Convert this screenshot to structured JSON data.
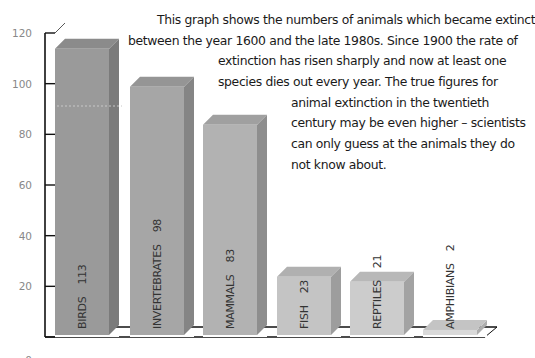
{
  "chart_data": {
    "type": "bar",
    "style": "3d-columns",
    "title": "",
    "xlabel": "",
    "ylabel": "",
    "ylim": [
      0,
      120
    ],
    "yticks": [
      0,
      20,
      40,
      60,
      80,
      100,
      120
    ],
    "grid": false,
    "legend": null,
    "categories": [
      "BIRDS",
      "INVERTEBRATES",
      "MAMMALS",
      "FISH",
      "REPTILES",
      "AMPHIBIANS"
    ],
    "values": [
      113,
      98,
      83,
      23,
      21,
      2
    ],
    "data_labels": [
      "113",
      "98",
      "83",
      "23",
      "21",
      "2"
    ],
    "annotation": "This graph shows the numbers of animals which became extinct between the year 1600 and the late 1980s. Since 1900 the rate of extinction has risen sharply and now at least one species dies out every year. The true figures for animal extinction in the twentieth century may be even higher – scientists can only guess at the animals they do not know about."
  },
  "colors": {
    "bar_shades": [
      "#9a9a9a",
      "#a6a6a6",
      "#b2b2b2",
      "#c4c4c4",
      "#cccccc",
      "#dadada"
    ],
    "axis": "#111111",
    "tick_label": "#888888",
    "text": "#1a1a1a"
  },
  "text_lines": [
    "This graph shows the numbers of animals which became extinct",
    "between the year 1600 and the late 1980s. Since 1900 the rate of",
    "extinction has risen sharply and now at least one",
    "species dies out every year. The true figures for",
    "animal extinction in the twentieth",
    "century may be even higher – scientists",
    "can only guess at the animals they do",
    "not know about."
  ]
}
